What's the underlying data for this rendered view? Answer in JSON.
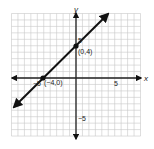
{
  "chart_data": {
    "type": "line",
    "title": "",
    "xlabel": "x",
    "ylabel": "y",
    "xlim": [
      -10,
      10
    ],
    "ylim": [
      -9,
      10
    ],
    "grid": true,
    "tick_labels": {
      "x": [
        {
          "value": -5,
          "label": "−5"
        },
        {
          "value": 5,
          "label": "5"
        }
      ],
      "y": [
        {
          "value": 5,
          "label": "5"
        },
        {
          "value": -5,
          "label": "−5"
        }
      ]
    },
    "series": [
      {
        "name": "line through (−4,0) and (0,4)",
        "equation": "y = x + 4",
        "x": [
          -9.5,
          9.5
        ],
        "y": [
          -5.5,
          13.5
        ],
        "arrows": "both"
      }
    ],
    "points": [
      {
        "x": 0,
        "y": 4,
        "label": "(0,4)"
      },
      {
        "x": -4,
        "y": 0,
        "label": "(−4,0)"
      }
    ]
  },
  "labels": {
    "x_axis": "x",
    "y_axis": "y",
    "x_tick_neg5": "−5",
    "x_tick_5": "5",
    "y_tick_5": "5",
    "y_tick_neg5": "−5",
    "point_y_intercept": "(0,4)",
    "point_x_intercept": "(−4,0)"
  },
  "colors": {
    "grid": "#c8c8c8",
    "axes": "#222222",
    "line": "#111111",
    "text": "#222222"
  }
}
